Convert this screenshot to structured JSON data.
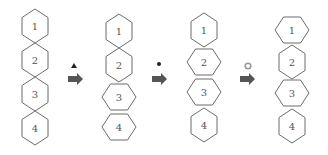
{
  "diagram": {
    "colors": {
      "stroke": "#6b6b6b",
      "label": "#555555",
      "arrow": "#555555",
      "marker_dark": "#222222",
      "marker_ring": "#999999"
    },
    "stages": [
      {
        "id": "stage-1",
        "hexagons": [
          {
            "label": "1",
            "cx": 35,
            "cy": 26,
            "orientation": "pointy"
          },
          {
            "label": "2",
            "cx": 35,
            "cy": 60,
            "orientation": "pointy"
          },
          {
            "label": "3",
            "cx": 35,
            "cy": 94,
            "orientation": "pointy"
          },
          {
            "label": "4",
            "cx": 35,
            "cy": 128,
            "orientation": "pointy"
          }
        ]
      },
      {
        "id": "stage-2",
        "hexagons": [
          {
            "label": "1",
            "cx": 119,
            "cy": 31,
            "orientation": "pointy"
          },
          {
            "label": "2",
            "cx": 119,
            "cy": 65,
            "orientation": "pointy"
          },
          {
            "label": "3",
            "cx": 119,
            "cy": 97,
            "orientation": "flat"
          },
          {
            "label": "4",
            "cx": 119,
            "cy": 127,
            "orientation": "flat"
          }
        ]
      },
      {
        "id": "stage-3",
        "hexagons": [
          {
            "label": "1",
            "cx": 204,
            "cy": 30,
            "orientation": "pointy"
          },
          {
            "label": "2",
            "cx": 204,
            "cy": 62,
            "orientation": "flat"
          },
          {
            "label": "3",
            "cx": 204,
            "cy": 92,
            "orientation": "flat"
          },
          {
            "label": "4",
            "cx": 204,
            "cy": 125,
            "orientation": "pointy"
          }
        ]
      },
      {
        "id": "stage-4",
        "hexagons": [
          {
            "label": "1",
            "cx": 292,
            "cy": 30,
            "orientation": "flat"
          },
          {
            "label": "2",
            "cx": 292,
            "cy": 62,
            "orientation": "pointy"
          },
          {
            "label": "3",
            "cx": 292,
            "cy": 93,
            "orientation": "flat"
          },
          {
            "label": "4",
            "cx": 292,
            "cy": 126,
            "orientation": "pointy"
          }
        ]
      }
    ],
    "transitions": [
      {
        "marker": "triangle",
        "marker_name": "filled-triangle",
        "mx": 74,
        "my": 66,
        "ax": 68,
        "ay": 79
      },
      {
        "marker": "dot",
        "marker_name": "filled-dot",
        "mx": 159,
        "my": 64,
        "ax": 152,
        "ay": 79
      },
      {
        "marker": "ring",
        "marker_name": "hollow-circle",
        "mx": 248,
        "my": 66,
        "ax": 240,
        "ay": 79
      }
    ]
  }
}
